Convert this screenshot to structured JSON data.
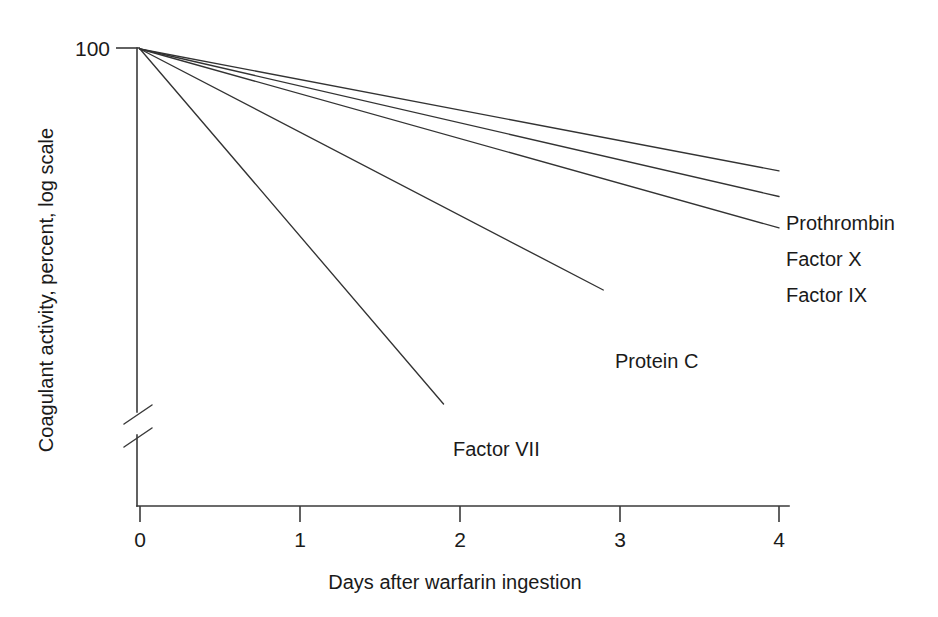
{
  "chart_data": {
    "type": "line",
    "title": "",
    "xlabel": "Days after warfarin ingestion",
    "ylabel": "Coagulant activity, percent, log scale",
    "x_ticks": [
      "0",
      "1",
      "2",
      "3",
      "4"
    ],
    "x_tick_values": [
      0,
      1,
      2,
      3,
      4
    ],
    "xlim": [
      0,
      4
    ],
    "y_ticks": [
      "100"
    ],
    "y_tick_values": [
      100
    ],
    "y_scale": "log",
    "y_axis_break": true,
    "grid": false,
    "legend_position": "inline-right-end-labels",
    "series": [
      {
        "name": "Prothrombin",
        "x": [
          0,
          4
        ],
        "values": [
          100,
          42
        ],
        "label_anchor_x": 4,
        "note": "slowest decline; reaches about 40 percent at day 4"
      },
      {
        "name": "Factor X",
        "x": [
          0,
          4
        ],
        "values": [
          100,
          35
        ],
        "label_anchor_x": 4,
        "note": "intermediate decline"
      },
      {
        "name": "Factor IX",
        "x": [
          0,
          4
        ],
        "values": [
          100,
          28
        ],
        "label_anchor_x": 4,
        "note": "intermediate decline, slightly faster than Factor X"
      },
      {
        "name": "Protein C",
        "x": [
          0,
          2.9
        ],
        "values": [
          100,
          18
        ],
        "label_anchor_x": 2.9,
        "note": "rapid decline, line terminates near day 3"
      },
      {
        "name": "Factor VII",
        "x": [
          0,
          1.9
        ],
        "values": [
          100,
          8
        ],
        "label_anchor_x": 1.9,
        "note": "fastest decline, shortest half-life; line terminates near day 2"
      }
    ]
  },
  "figure": {
    "background_color": "#ffffff",
    "line_color": "#333333",
    "axis_color": "#3a3a3a",
    "text_color": "#1a1a1a"
  },
  "labels": {
    "y_tick_100": "100",
    "x_tick_0": "0",
    "x_tick_1": "1",
    "x_tick_2": "2",
    "x_tick_3": "3",
    "x_tick_4": "4",
    "y_axis_title": "Coagulant activity, percent, log scale",
    "x_axis_title": "Days after warfarin ingestion",
    "series_prothrombin": "Prothrombin",
    "series_factor_x": "Factor X",
    "series_factor_ix": "Factor IX",
    "series_protein_c": "Protein C",
    "series_factor_vii": "Factor VII"
  }
}
